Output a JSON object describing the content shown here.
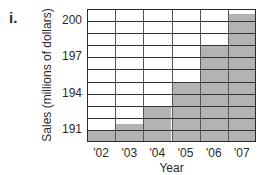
{
  "figure_label": "i.",
  "chart_data": {
    "type": "bar",
    "title": "",
    "xlabel": "Year",
    "ylabel": "Sales (millions of dollars)",
    "categories": [
      "'02",
      "'03",
      "'04",
      "'05",
      "'06",
      "'07"
    ],
    "values": [
      191,
      191.5,
      193,
      195,
      198,
      200.6
    ],
    "ylim": [
      190,
      201
    ],
    "yticks": [
      191,
      194,
      197,
      200
    ],
    "ytick_labels": [
      "191",
      "194",
      "197",
      "200"
    ],
    "grid": true,
    "grid_step": 1,
    "legend": null,
    "bar_color": "#b3b3b3",
    "gridline_color": "#333333"
  }
}
